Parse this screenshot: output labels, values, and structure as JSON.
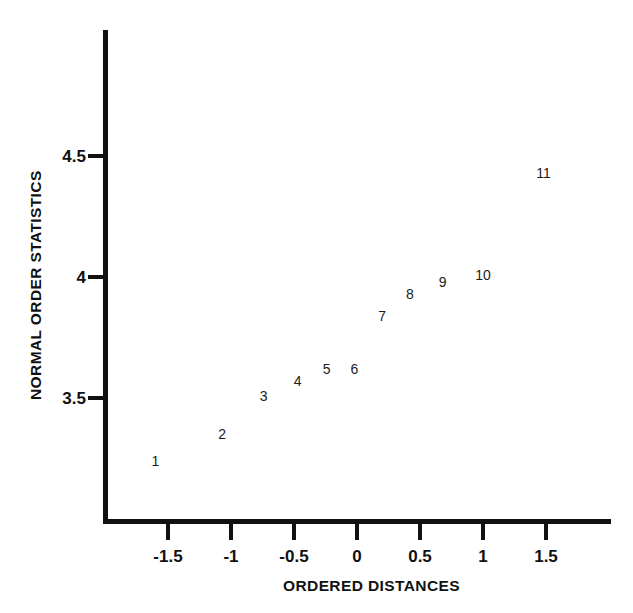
{
  "chart_data": {
    "type": "scatter",
    "title": "",
    "subtitle": "",
    "xlabel": "ORDERED DISTANCES",
    "ylabel": "NORMAL ORDER STATISTICS",
    "xlim": [
      -1.9,
      2.0
    ],
    "ylim": [
      3.1,
      4.75
    ],
    "grid": false,
    "legend": null,
    "marker_style": "point-index-number",
    "x_ticks": [
      {
        "label": "-1.5",
        "value": -1.5
      },
      {
        "label": "-1",
        "value": -1
      },
      {
        "label": "-0.5",
        "value": -0.5
      },
      {
        "label": "0",
        "value": 0
      },
      {
        "label": "0.5",
        "value": 0.5
      },
      {
        "label": "1",
        "value": 1
      },
      {
        "label": "1.5",
        "value": 1.5
      }
    ],
    "y_ticks": [
      {
        "label": "4.5",
        "value": 4.5
      },
      {
        "label": "4",
        "value": 4
      },
      {
        "label": "3.5",
        "value": 3.5
      }
    ],
    "points": [
      {
        "label": "1",
        "x": -1.6,
        "y": 3.24
      },
      {
        "label": "2",
        "x": -1.07,
        "y": 3.35
      },
      {
        "label": "3",
        "x": -0.74,
        "y": 3.51
      },
      {
        "label": "4",
        "x": -0.47,
        "y": 3.57
      },
      {
        "label": "5",
        "x": -0.24,
        "y": 3.62
      },
      {
        "label": "6",
        "x": -0.02,
        "y": 3.62
      },
      {
        "label": "7",
        "x": 0.2,
        "y": 3.84
      },
      {
        "label": "8",
        "x": 0.42,
        "y": 3.93
      },
      {
        "label": "9",
        "x": 0.68,
        "y": 3.98
      },
      {
        "label": "10",
        "x": 1.0,
        "y": 4.01
      },
      {
        "label": "11",
        "x": 1.48,
        "y": 4.43
      }
    ],
    "colors": {
      "axis": "#111111",
      "text": "#111111",
      "marker": "#1b1b1b",
      "background": "#ffffff"
    }
  }
}
